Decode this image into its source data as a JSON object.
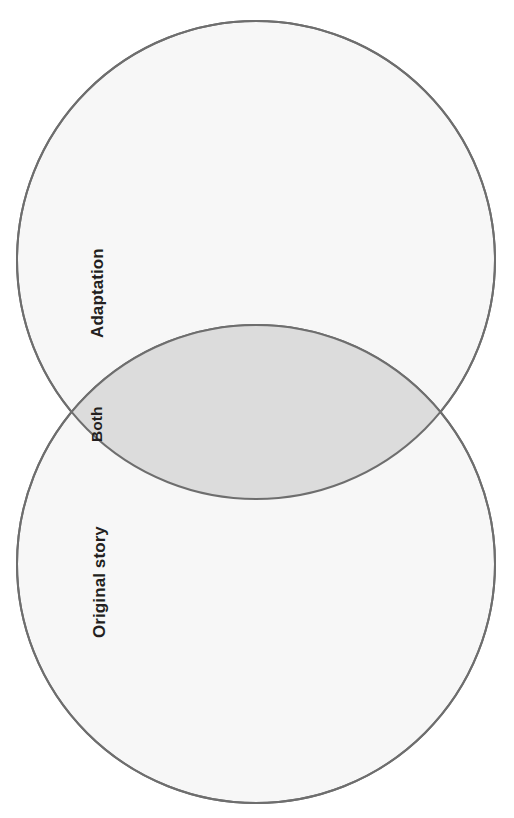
{
  "page": {
    "background_color": "#ffffff",
    "width": 514,
    "height": 818,
    "orientation": "rotated-90-counterclockwise"
  },
  "diagram": {
    "type": "venn-2-set",
    "orientation_note": "Two overlapping circles stacked vertically; all labels rotated 90 degrees counter-clockwise",
    "circle_fill_color": "#f7f7f7",
    "circle_stroke_color": "#6e6e6e",
    "overlap_fill_color": "#dcdcdc",
    "overlap_stroke_color": "#5a5a5a",
    "stroke_width": 2,
    "circles": [
      {
        "id": "upper-circle",
        "label": "Adaptation",
        "center_x": 256,
        "center_y": 260,
        "radius": 239
      },
      {
        "id": "lower-circle",
        "label": "Original story",
        "center_x": 256,
        "center_y": 564,
        "radius": 239
      }
    ],
    "overlap": {
      "id": "lens",
      "label": "Both",
      "left_intersection_x": 58,
      "left_intersection_y": 412,
      "right_intersection_x": 456,
      "right_intersection_y": 412
    }
  },
  "labels": {
    "adaptation": "Adaptation",
    "both": "Both",
    "original_story": "Original story",
    "cut_off_header": ""
  }
}
